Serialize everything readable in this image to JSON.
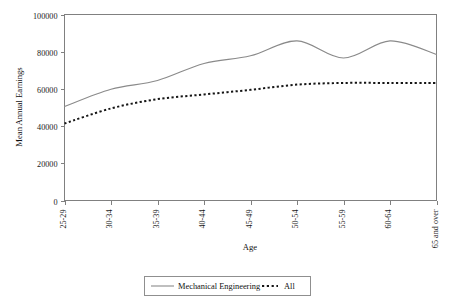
{
  "chart_data": {
    "type": "line",
    "title": "",
    "xlabel": "Age",
    "ylabel": "Mean Annual Earnings",
    "categories": [
      "25-29",
      "30-34",
      "35-39",
      "40-44",
      "45-49",
      "50-54",
      "55-59",
      "60-64",
      "65 and over"
    ],
    "ylim": [
      0,
      100000
    ],
    "yticks": [
      0,
      20000,
      40000,
      60000,
      80000,
      100000
    ],
    "ytick_labels": [
      "0",
      "20000",
      "40000",
      "60000",
      "80000",
      "100000"
    ],
    "grid": false,
    "legend_position": "bottom",
    "series": [
      {
        "name": "Mechanical Engineering",
        "style": "solid",
        "color": "#8a8a8a",
        "values": [
          50500,
          59800,
          64500,
          73700,
          77800,
          85800,
          76600,
          85800,
          78500
        ]
      },
      {
        "name": "All",
        "style": "dotted",
        "color": "#151515",
        "values": [
          41400,
          49500,
          54500,
          57000,
          59500,
          62300,
          63200,
          63200,
          63200
        ]
      }
    ]
  },
  "legend": {
    "items": [
      {
        "label": "Mechanical Engineering"
      },
      {
        "label": "All"
      }
    ]
  },
  "axes": {
    "x_title": "Age",
    "y_title": "Mean Annual Earnings"
  }
}
